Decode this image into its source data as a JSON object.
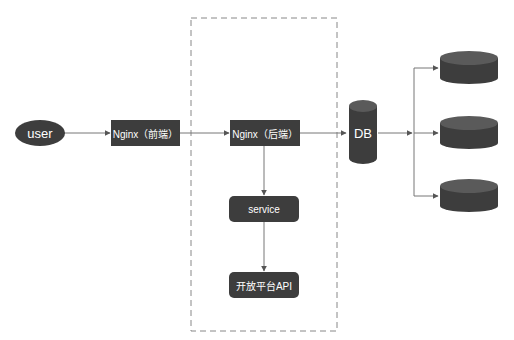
{
  "diagram": {
    "colors": {
      "node_fill": "#3d3d3d",
      "edge": "#777777",
      "boundary": "#888888",
      "db_top": "#5a5a5a",
      "text": "#ffffff"
    },
    "nodes": {
      "user": {
        "label": "user",
        "shape": "ellipse"
      },
      "nginx_front": {
        "label": "Nginx（前端）",
        "shape": "rect"
      },
      "nginx_back": {
        "label": "Nginx（后端）",
        "shape": "rect"
      },
      "service": {
        "label": "service",
        "shape": "rounded-rect"
      },
      "open_api": {
        "label": "开放平台API",
        "shape": "rounded-rect"
      },
      "db": {
        "label": "DB",
        "shape": "cylinder"
      },
      "db_replica_1": {
        "label": "",
        "shape": "cylinder"
      },
      "db_replica_2": {
        "label": "",
        "shape": "cylinder"
      },
      "db_replica_3": {
        "label": "",
        "shape": "cylinder"
      }
    },
    "edges": [
      {
        "from": "user",
        "to": "nginx_front"
      },
      {
        "from": "nginx_front",
        "to": "nginx_back"
      },
      {
        "from": "nginx_back",
        "to": "db"
      },
      {
        "from": "nginx_back",
        "to": "service"
      },
      {
        "from": "service",
        "to": "open_api"
      },
      {
        "from": "db",
        "to": "db_replica_1"
      },
      {
        "from": "db",
        "to": "db_replica_2"
      },
      {
        "from": "db",
        "to": "db_replica_3"
      }
    ],
    "boundary": {
      "style": "dashed",
      "contains": [
        "nginx_back",
        "service",
        "open_api"
      ]
    }
  }
}
